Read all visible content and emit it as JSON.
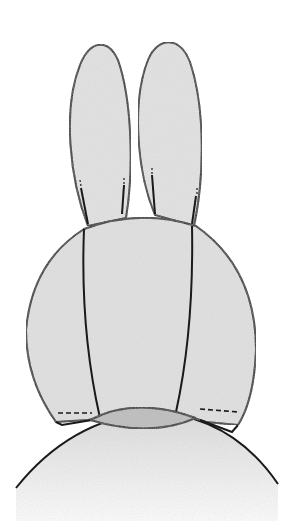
{
  "diagram": {
    "colors": {
      "background": "#ffffff",
      "stroke": "#1a1a1a",
      "fill_light": "#e4e4e4",
      "fill_mid": "#d6d6d6",
      "fill_dark": "#bdbdbd"
    },
    "parts": [
      "left-ear",
      "right-ear",
      "head",
      "neck-oval",
      "body"
    ]
  }
}
